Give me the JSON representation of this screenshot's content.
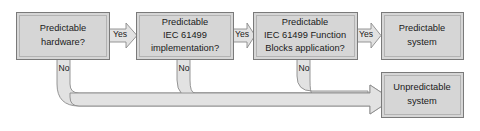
{
  "diagram": {
    "colors": {
      "node_fill": "#d6d6d6",
      "node_stroke": "#7a7a7a",
      "connector_fill": "#e2e2e2",
      "connector_stroke": "#8a8a8a",
      "text": "#1a1a1a",
      "background": "#ffffff"
    },
    "nodes": [
      {
        "id": "node-predictable-hardware",
        "name": "predictable-hardware-decision",
        "lines": [
          "Predictable",
          "hardware?"
        ],
        "line1": "Predictable",
        "line2": "hardware?",
        "line3": "",
        "x": 16,
        "y": 12,
        "w": 93,
        "h": 47
      },
      {
        "id": "node-predictable-implementation",
        "name": "predictable-iec61499-implementation-decision",
        "lines": [
          "Predictable",
          "IEC 61499",
          "implementation?"
        ],
        "line1": "Predictable",
        "line2": "IEC 61499",
        "line3": "implementation?",
        "x": 136,
        "y": 12,
        "w": 97,
        "h": 47
      },
      {
        "id": "node-predictable-function-blocks",
        "name": "predictable-iec61499-function-blocks-decision",
        "lines": [
          "Predictable",
          "IEC 61499 Function",
          "Blocks application?"
        ],
        "line1": "Predictable",
        "line2": "IEC 61499 Function",
        "line3": "Blocks application?",
        "x": 253,
        "y": 12,
        "w": 104,
        "h": 47
      },
      {
        "id": "node-predictable-system",
        "name": "predictable-system-outcome",
        "lines": [
          "Predictable",
          "system"
        ],
        "line1": "Predictable",
        "line2": "system",
        "line3": "",
        "x": 381,
        "y": 12,
        "w": 82,
        "h": 47
      },
      {
        "id": "node-unpredictable-system",
        "name": "unpredictable-system-outcome",
        "lines": [
          "Unpredictable",
          "system"
        ],
        "line1": "Unpredictable",
        "line2": "system",
        "line3": "",
        "x": 381,
        "y": 72,
        "w": 82,
        "h": 45
      }
    ],
    "edges": [
      {
        "id": "edge-yes-1",
        "name": "yes-arrow-hardware-to-implementation",
        "label": "Yes",
        "label_x": 120,
        "label_y": 35
      },
      {
        "id": "edge-yes-2",
        "name": "yes-arrow-implementation-to-function-blocks",
        "label": "Yes",
        "label_x": 242,
        "label_y": 35
      },
      {
        "id": "edge-yes-3",
        "name": "yes-arrow-function-blocks-to-predictable-system",
        "label": "Yes",
        "label_x": 366,
        "label_y": 35
      },
      {
        "id": "edge-no-1",
        "name": "no-arrow-hardware-to-unpredictable",
        "label": "No",
        "label_x": 66,
        "label_y": 69
      },
      {
        "id": "edge-no-2",
        "name": "no-arrow-implementation-to-unpredictable",
        "label": "No",
        "label_x": 186,
        "label_y": 69
      },
      {
        "id": "edge-no-3",
        "name": "no-arrow-function-blocks-to-unpredictable",
        "label": "No",
        "label_x": 306,
        "label_y": 69
      }
    ]
  }
}
